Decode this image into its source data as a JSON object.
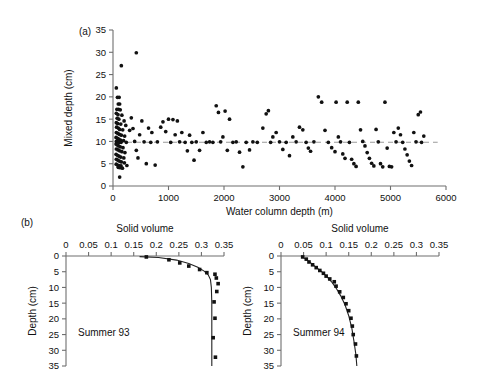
{
  "figure": {
    "panel_a_label": "(a)",
    "panel_b_label": "(b)"
  },
  "chart_data": [
    {
      "id": "panel_a",
      "type": "scatter",
      "title": "",
      "xlabel": "Water column depth (m)",
      "ylabel": "Mixed depth (cm)",
      "xlim": [
        0,
        6000
      ],
      "ylim": [
        0,
        35
      ],
      "xticks": [
        0,
        1000,
        2000,
        3000,
        4000,
        5000,
        6000
      ],
      "yticks": [
        0,
        5,
        10,
        15,
        20,
        25,
        30,
        35
      ],
      "grid": false,
      "legend": "none",
      "reference_line": {
        "orientation": "horizontal",
        "y": 9.8,
        "style": "dashed",
        "color": "#9a9a9a"
      },
      "points": [
        [
          60,
          22.0
        ],
        [
          80,
          19.9
        ],
        [
          110,
          19.9
        ],
        [
          95,
          18.4
        ],
        [
          120,
          18.4
        ],
        [
          150,
          27.0
        ],
        [
          420,
          29.9
        ],
        [
          70,
          17.2
        ],
        [
          100,
          17.2
        ],
        [
          130,
          17.1
        ],
        [
          60,
          16.3
        ],
        [
          90,
          16.0
        ],
        [
          160,
          15.9
        ],
        [
          75,
          15.2
        ],
        [
          105,
          15.0
        ],
        [
          200,
          14.6
        ],
        [
          60,
          14.2
        ],
        [
          85,
          14.0
        ],
        [
          140,
          13.9
        ],
        [
          230,
          13.6
        ],
        [
          65,
          13.2
        ],
        [
          95,
          13.0
        ],
        [
          120,
          12.7
        ],
        [
          175,
          12.6
        ],
        [
          300,
          12.5
        ],
        [
          60,
          12.0
        ],
        [
          88,
          11.8
        ],
        [
          115,
          11.6
        ],
        [
          150,
          11.4
        ],
        [
          210,
          11.2
        ],
        [
          55,
          10.9
        ],
        [
          80,
          10.7
        ],
        [
          105,
          10.5
        ],
        [
          135,
          10.3
        ],
        [
          190,
          10.2
        ],
        [
          60,
          10.0
        ],
        [
          85,
          9.9
        ],
        [
          110,
          9.8
        ],
        [
          145,
          9.8
        ],
        [
          240,
          9.8
        ],
        [
          55,
          9.4
        ],
        [
          78,
          9.2
        ],
        [
          100,
          9.0
        ],
        [
          130,
          8.8
        ],
        [
          180,
          8.6
        ],
        [
          60,
          8.3
        ],
        [
          90,
          8.1
        ],
        [
          120,
          7.9
        ],
        [
          160,
          7.7
        ],
        [
          215,
          7.5
        ],
        [
          55,
          7.1
        ],
        [
          80,
          6.9
        ],
        [
          108,
          6.7
        ],
        [
          140,
          6.5
        ],
        [
          195,
          6.3
        ],
        [
          60,
          6.0
        ],
        [
          88,
          5.8
        ],
        [
          115,
          5.6
        ],
        [
          150,
          5.4
        ],
        [
          205,
          5.2
        ],
        [
          58,
          4.9
        ],
        [
          82,
          4.7
        ],
        [
          110,
          4.6
        ],
        [
          145,
          4.5
        ],
        [
          250,
          4.6
        ],
        [
          95,
          4.2
        ],
        [
          130,
          4.1
        ],
        [
          170,
          4.0
        ],
        [
          120,
          2.0
        ],
        [
          330,
          15.3
        ],
        [
          360,
          12.9
        ],
        [
          390,
          10.0
        ],
        [
          420,
          8.0
        ],
        [
          450,
          6.3
        ],
        [
          480,
          11.5
        ],
        [
          520,
          14.6
        ],
        [
          560,
          9.9
        ],
        [
          600,
          5.0
        ],
        [
          640,
          13.0
        ],
        [
          680,
          9.8
        ],
        [
          700,
          12.0
        ],
        [
          760,
          4.7
        ],
        [
          800,
          9.9
        ],
        [
          860,
          13.2
        ],
        [
          900,
          14.4
        ],
        [
          950,
          12.2
        ],
        [
          1000,
          15.0
        ],
        [
          1040,
          9.8
        ],
        [
          1080,
          14.9
        ],
        [
          1120,
          11.5
        ],
        [
          1160,
          14.6
        ],
        [
          1200,
          9.9
        ],
        [
          1240,
          12.0
        ],
        [
          1300,
          9.8
        ],
        [
          1340,
          7.9
        ],
        [
          1380,
          11.4
        ],
        [
          1420,
          9.8
        ],
        [
          1460,
          5.8
        ],
        [
          1500,
          9.9
        ],
        [
          1560,
          8.0
        ],
        [
          1620,
          12.0
        ],
        [
          1680,
          9.8
        ],
        [
          1740,
          9.9
        ],
        [
          1800,
          9.8
        ],
        [
          1860,
          18.0
        ],
        [
          1900,
          16.5
        ],
        [
          1940,
          9.9
        ],
        [
          1980,
          11.0
        ],
        [
          2020,
          16.8
        ],
        [
          2060,
          8.0
        ],
        [
          2100,
          15.0
        ],
        [
          2160,
          9.8
        ],
        [
          2220,
          9.9
        ],
        [
          2280,
          7.6
        ],
        [
          2340,
          4.3
        ],
        [
          2400,
          9.8
        ],
        [
          2460,
          8.1
        ],
        [
          2520,
          9.9
        ],
        [
          2600,
          9.8
        ],
        [
          2700,
          13.0
        ],
        [
          2760,
          16.2
        ],
        [
          2800,
          16.9
        ],
        [
          2840,
          9.8
        ],
        [
          2880,
          11.0
        ],
        [
          2940,
          12.0
        ],
        [
          3000,
          9.9
        ],
        [
          3060,
          8.2
        ],
        [
          3120,
          9.8
        ],
        [
          3180,
          6.8
        ],
        [
          3240,
          11.0
        ],
        [
          3300,
          9.9
        ],
        [
          3360,
          13.2
        ],
        [
          3420,
          12.6
        ],
        [
          3480,
          9.8
        ],
        [
          3520,
          8.5
        ],
        [
          3560,
          7.8
        ],
        [
          3620,
          9.9
        ],
        [
          3700,
          20.0
        ],
        [
          3760,
          18.8
        ],
        [
          3820,
          12.5
        ],
        [
          3880,
          9.8
        ],
        [
          3940,
          8.6
        ],
        [
          4000,
          7.7
        ],
        [
          4020,
          18.8
        ],
        [
          4060,
          11.0
        ],
        [
          4100,
          9.9
        ],
        [
          4140,
          7.2
        ],
        [
          4180,
          6.2
        ],
        [
          4220,
          18.8
        ],
        [
          4260,
          9.8
        ],
        [
          4300,
          6.0
        ],
        [
          4340,
          5.0
        ],
        [
          4380,
          4.4
        ],
        [
          4420,
          18.8
        ],
        [
          4460,
          12.6
        ],
        [
          4500,
          10.0
        ],
        [
          4540,
          9.0
        ],
        [
          4580,
          7.5
        ],
        [
          4620,
          6.2
        ],
        [
          4660,
          5.1
        ],
        [
          4700,
          4.5
        ],
        [
          4740,
          12.7
        ],
        [
          4780,
          9.9
        ],
        [
          4820,
          5.0
        ],
        [
          4860,
          4.3
        ],
        [
          4900,
          18.8
        ],
        [
          4940,
          8.5
        ],
        [
          4980,
          4.4
        ],
        [
          5020,
          4.3
        ],
        [
          5060,
          12.0
        ],
        [
          5100,
          9.9
        ],
        [
          5140,
          13.0
        ],
        [
          5180,
          11.5
        ],
        [
          5220,
          9.8
        ],
        [
          5260,
          8.3
        ],
        [
          5300,
          7.0
        ],
        [
          5340,
          5.6
        ],
        [
          5380,
          4.6
        ],
        [
          5420,
          12.0
        ],
        [
          5460,
          9.9
        ],
        [
          5500,
          16.0
        ],
        [
          5540,
          16.6
        ],
        [
          5560,
          9.8
        ],
        [
          5600,
          11.2
        ]
      ]
    },
    {
      "id": "panel_b_summer93",
      "type": "line",
      "annotation": "Summer 93",
      "title": "Solid volume",
      "xlabel": "",
      "ylabel": "Depth (cm)",
      "xlim": [
        0,
        0.35
      ],
      "ylim": [
        0,
        35
      ],
      "xticks": [
        0,
        0.05,
        0.1,
        0.15,
        0.2,
        0.25,
        0.3,
        0.35
      ],
      "xtick_labels": [
        "0",
        "0.05",
        "0.1",
        "0.15",
        "0.2",
        "0.25",
        "0.3",
        "0.35"
      ],
      "yticks": [
        0,
        5,
        10,
        15,
        20,
        25,
        30,
        35
      ],
      "grid": false,
      "legend": "none",
      "y_axis_inverted": true,
      "points": [
        [
          0.178,
          0.3
        ],
        [
          0.228,
          1.2
        ],
        [
          0.252,
          2.2
        ],
        [
          0.272,
          3.2
        ],
        [
          0.296,
          4.3
        ],
        [
          0.312,
          5.3
        ],
        [
          0.33,
          5.8
        ],
        [
          0.333,
          7.0
        ],
        [
          0.337,
          8.8
        ],
        [
          0.334,
          11.3
        ],
        [
          0.328,
          14.6
        ],
        [
          0.33,
          19.8
        ],
        [
          0.326,
          26.0
        ],
        [
          0.331,
          32.2
        ]
      ],
      "fit_curve": [
        [
          0.163,
          0.2
        ],
        [
          0.205,
          0.5
        ],
        [
          0.245,
          1.3
        ],
        [
          0.272,
          2.4
        ],
        [
          0.292,
          3.6
        ],
        [
          0.306,
          4.8
        ],
        [
          0.315,
          6.0
        ],
        [
          0.32,
          7.5
        ],
        [
          0.322,
          10.0
        ],
        [
          0.323,
          15.0
        ],
        [
          0.323,
          22.0
        ],
        [
          0.323,
          29.0
        ],
        [
          0.323,
          35.0
        ]
      ]
    },
    {
      "id": "panel_b_summer94",
      "type": "line",
      "annotation": "Summer 94",
      "title": "Solid volume",
      "xlabel": "",
      "ylabel": "Depth (cm)",
      "xlim": [
        0,
        0.35
      ],
      "ylim": [
        0,
        35
      ],
      "xticks": [
        0,
        0.05,
        0.1,
        0.15,
        0.2,
        0.25,
        0.3,
        0.35
      ],
      "xtick_labels": [
        "0",
        "0.05",
        "0.1",
        "0.15",
        "0.2",
        "0.25",
        "0.3",
        "0.35"
      ],
      "yticks": [
        0,
        5,
        10,
        15,
        20,
        25,
        30,
        35
      ],
      "grid": false,
      "legend": "none",
      "y_axis_inverted": true,
      "points": [
        [
          0.048,
          0.3
        ],
        [
          0.056,
          1.0
        ],
        [
          0.062,
          1.9
        ],
        [
          0.07,
          2.8
        ],
        [
          0.078,
          3.7
        ],
        [
          0.086,
          4.6
        ],
        [
          0.094,
          5.5
        ],
        [
          0.1,
          6.4
        ],
        [
          0.108,
          7.3
        ],
        [
          0.118,
          8.2
        ],
        [
          0.122,
          9.6
        ],
        [
          0.13,
          11.4
        ],
        [
          0.138,
          13.2
        ],
        [
          0.144,
          15.2
        ],
        [
          0.15,
          17.4
        ],
        [
          0.155,
          19.8
        ],
        [
          0.158,
          22.3
        ],
        [
          0.16,
          25.0
        ],
        [
          0.165,
          28.0
        ],
        [
          0.167,
          31.8
        ]
      ],
      "fit_curve": [
        [
          0.046,
          0.2
        ],
        [
          0.055,
          1.0
        ],
        [
          0.066,
          2.2
        ],
        [
          0.078,
          3.6
        ],
        [
          0.09,
          5.0
        ],
        [
          0.101,
          6.5
        ],
        [
          0.112,
          8.2
        ],
        [
          0.122,
          10.2
        ],
        [
          0.132,
          12.6
        ],
        [
          0.142,
          15.6
        ],
        [
          0.15,
          19.0
        ],
        [
          0.157,
          23.0
        ],
        [
          0.162,
          27.5
        ],
        [
          0.166,
          31.5
        ],
        [
          0.168,
          35.0
        ]
      ]
    }
  ]
}
